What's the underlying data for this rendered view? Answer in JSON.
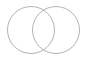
{
  "diagram": {
    "type": "venn",
    "stroke_color": "#b4b4b4",
    "background": "#ffffff",
    "circles": [
      {
        "name": "left-circle",
        "cx": 31,
        "cy": 30,
        "r": 23.5
      },
      {
        "name": "right-circle",
        "cx": 56,
        "cy": 30,
        "r": 23.5
      }
    ]
  }
}
